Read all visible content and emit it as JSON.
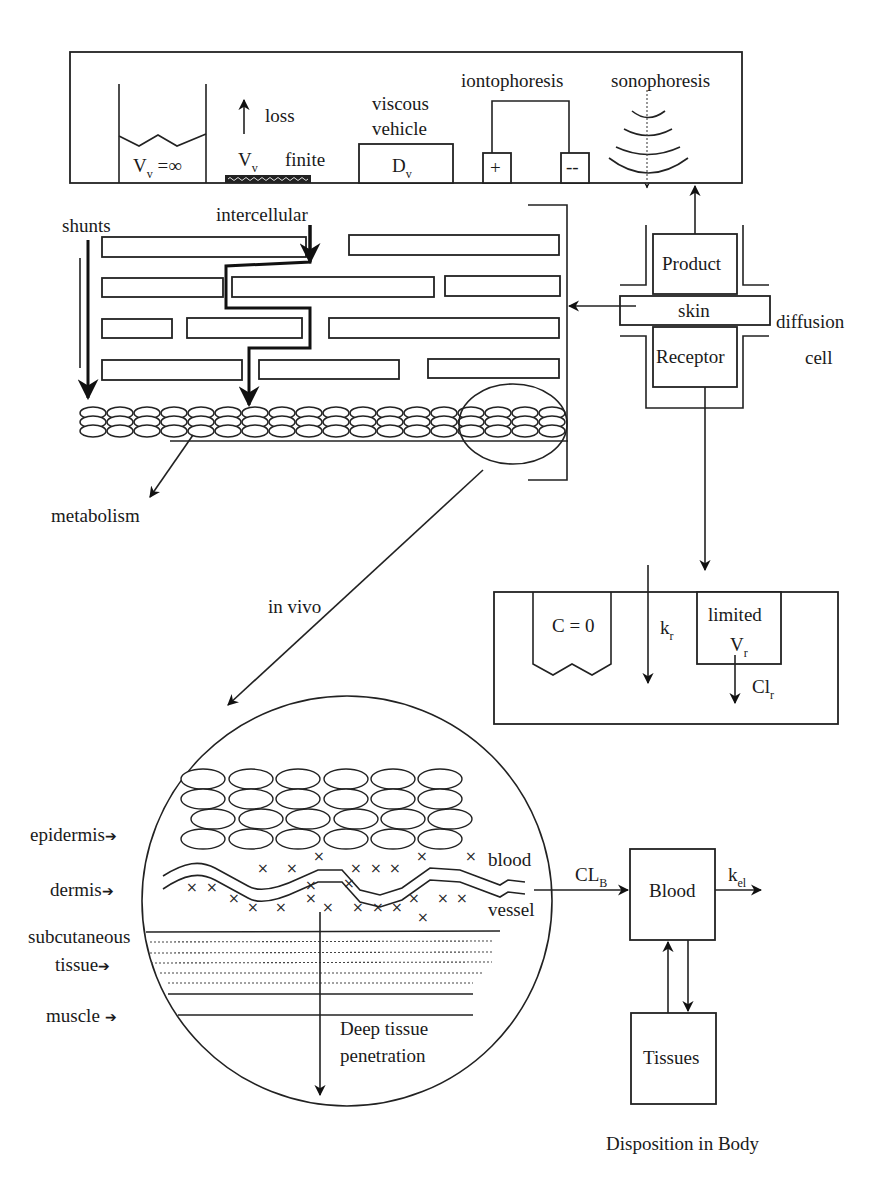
{
  "figure": {
    "colors": {
      "stroke": "#222222",
      "background": "#ffffff",
      "text": "#1a1a1a"
    }
  },
  "vehicle_panel": {
    "infinite_dose": {
      "label_main": "V",
      "label_sub": "v",
      "label_rest": " =∞"
    },
    "finite_dose": {
      "loss_label": "loss",
      "label_main": "V",
      "label_sub": "v",
      "finite_label": "finite"
    },
    "viscous": {
      "line1": "viscous",
      "line2": "vehicle",
      "box_main": "D",
      "box_sub": "v"
    },
    "iontophoresis": {
      "label": "iontophoresis",
      "plus": "+",
      "minus": "--"
    },
    "sonophoresis": {
      "label": "sonophoresis"
    }
  },
  "stratum_corneum": {
    "shunts_label": "shunts",
    "intercellular_label": "intercellular",
    "metabolism_label": "metabolism",
    "in_vivo_label": "in vivo"
  },
  "diffusion_cell": {
    "product_label": "Product",
    "skin_label": "skin",
    "receptor_label": "Receptor",
    "side_label_1": "diffusion",
    "side_label_2": "cell"
  },
  "receptor_panel": {
    "sink_label": "C = 0",
    "rate_main": "k",
    "rate_sub": "r",
    "limited_label": "limited",
    "volume_main": "V",
    "volume_sub": "r",
    "clearance_main": "Cl",
    "clearance_sub": "r"
  },
  "in_vivo_section": {
    "layers": [
      {
        "label": "epidermis"
      },
      {
        "label": "dermis"
      },
      {
        "label": "subcutaneous"
      },
      {
        "label": "tissue"
      },
      {
        "label": "muscle"
      }
    ],
    "blood_label": "blood",
    "vessel_label": "vessel",
    "deep_label_1": "Deep tissue",
    "deep_label_2": "penetration",
    "arrow_glyph": "➔"
  },
  "disposition": {
    "clearance_main": "CL",
    "clearance_sub": "B",
    "blood_label": "Blood",
    "elim_main": "k",
    "elim_sub": "el",
    "tissues_label": "Tissues",
    "caption": "Disposition in Body"
  }
}
